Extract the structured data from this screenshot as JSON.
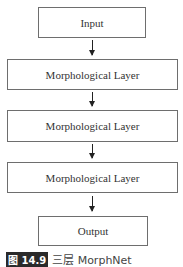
{
  "diagram": {
    "nodes": [
      {
        "id": "input",
        "label": "Input"
      },
      {
        "id": "layer1",
        "label": "Morphological Layer"
      },
      {
        "id": "layer2",
        "label": "Morphological Layer"
      },
      {
        "id": "layer3",
        "label": "Morphological Layer"
      },
      {
        "id": "output",
        "label": "Output"
      }
    ],
    "edges": [
      {
        "from": "input",
        "to": "layer1"
      },
      {
        "from": "layer1",
        "to": "layer2"
      },
      {
        "from": "layer2",
        "to": "layer3"
      },
      {
        "from": "layer3",
        "to": "output"
      }
    ]
  },
  "caption": {
    "badge": "图 14.9",
    "text": "三层 MorphNet"
  }
}
